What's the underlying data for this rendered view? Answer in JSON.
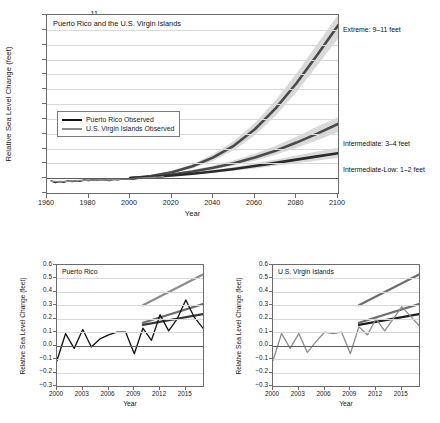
{
  "figure": {
    "cropped_title_fragment": ""
  },
  "main_panel": {
    "tag": "Puerto Rico and the U.S. Virgin Islands",
    "ylabel": "Relative Sea Level Change (feet)",
    "xlabel": "Year",
    "yticks": [
      "11",
      "10",
      "9",
      "8",
      "7",
      "6",
      "5",
      "4",
      "3",
      "2",
      "1",
      "0",
      "−1"
    ],
    "xticks": [
      "1960",
      "1980",
      "2000",
      "2020",
      "2040",
      "2060",
      "2080",
      "2100"
    ],
    "legend": [
      {
        "label": "Puerto Rico Observed",
        "color": "#111111"
      },
      {
        "label": "U.S. Virgin Islands Observed",
        "color": "#8d8d8d"
      }
    ],
    "annotations": [
      {
        "name": "extreme",
        "label": "Extreme: 9–11 feet"
      },
      {
        "name": "intermediate",
        "label": "Intermediate: 3–4 feet"
      },
      {
        "name": "intermediate-low",
        "label": "Intermediate-Low: 1–2 feet"
      }
    ]
  },
  "sub_panels": [
    {
      "key": "puerto-rico",
      "tag": "Puerto Rico",
      "ylabel": "Relative Sea Level Change (feet)",
      "xlabel": "Year",
      "yticks": [
        "0.6",
        "0.5",
        "0.4",
        "0.3",
        "0.2",
        "0.1",
        "0.0",
        "−0.1",
        "−0.2",
        "−0.3"
      ],
      "xticks": [
        "2000",
        "2003",
        "2006",
        "2009",
        "2012",
        "2015"
      ]
    },
    {
      "key": "us-virgin-islands",
      "tag": "U.S. Virgin Islands",
      "ylabel": "Relative Sea Level Change (feet)",
      "xlabel": "Year",
      "yticks": [
        "0.6",
        "0.5",
        "0.4",
        "0.3",
        "0.2",
        "0.1",
        "0.0",
        "−0.1",
        "−0.2",
        "−0.3"
      ],
      "xticks": [
        "2000",
        "2003",
        "2006",
        "2009",
        "2012",
        "2015"
      ]
    }
  ],
  "colors": {
    "observed_pr": "#111111",
    "observed_usvi": "#8d8d8d",
    "scenario_line_dark": "#4a4a4a",
    "scenario_line_darkest": "#2b2b2b",
    "band_light": "#d9d9d9",
    "band_mid": "#bfbfbf",
    "axis": "#6b6b6b",
    "grid": "#d8d8d8"
  },
  "chart_data": {
    "type": "line",
    "panels": [
      {
        "name": "main-projection",
        "title": "Puerto Rico and the U.S. Virgin Islands",
        "xlabel": "Year",
        "ylabel": "Relative Sea Level Change (feet)",
        "xlim": [
          1960,
          2100
        ],
        "ylim": [
          -1,
          11
        ],
        "xticks": [
          1960,
          1980,
          2000,
          2020,
          2040,
          2060,
          2080,
          2100
        ],
        "yticks": [
          -1,
          0,
          1,
          2,
          3,
          4,
          5,
          6,
          7,
          8,
          9,
          10,
          11
        ],
        "grid": true,
        "legend_position": "inside-left",
        "series": [
          {
            "name": "Puerto Rico Observed",
            "type": "observed",
            "color": "#111111",
            "x": [
              1962,
              1964,
              1966,
              1968,
              1970,
              1972,
              1974,
              1976,
              1978,
              1980,
              1982,
              1984,
              1986,
              1988,
              1990,
              1992,
              1994,
              1996,
              1998,
              2000,
              2002,
              2004,
              2006,
              2008,
              2010,
              2012,
              2014,
              2016
            ],
            "values": [
              -0.18,
              -0.3,
              -0.22,
              -0.28,
              -0.18,
              -0.22,
              -0.17,
              -0.2,
              -0.13,
              -0.16,
              -0.1,
              -0.14,
              -0.09,
              -0.12,
              -0.16,
              -0.08,
              -0.1,
              -0.05,
              -0.07,
              -0.02,
              -0.04,
              0.0,
              0.02,
              0.02,
              0.05,
              0.07,
              0.09,
              0.11
            ]
          },
          {
            "name": "U.S. Virgin Islands Observed",
            "type": "observed",
            "color": "#8d8d8d",
            "x": [
              1962,
              1966,
              1970,
              1974,
              1978,
              1982,
              1986,
              1990,
              1994,
              1998,
              2002,
              2006,
              2010,
              2014,
              2016
            ],
            "values": [
              -0.2,
              -0.24,
              -0.2,
              -0.18,
              -0.14,
              -0.12,
              -0.1,
              -0.13,
              -0.08,
              -0.05,
              -0.03,
              0.01,
              0.04,
              0.08,
              0.11
            ]
          },
          {
            "name": "Extreme",
            "type": "projection",
            "label": "Extreme: 9–11 feet",
            "color": "#4a4a4a",
            "x": [
              2000,
              2010,
              2020,
              2030,
              2040,
              2050,
              2060,
              2070,
              2080,
              2090,
              2100
            ],
            "values": [
              0.0,
              0.15,
              0.4,
              0.8,
              1.4,
              2.2,
              3.3,
              4.7,
              6.4,
              8.3,
              10.3
            ],
            "band_low": [
              0.0,
              0.12,
              0.32,
              0.66,
              1.18,
              1.9,
              2.9,
              4.2,
              5.8,
              7.6,
              9.4
            ],
            "band_high": [
              0.0,
              0.18,
              0.48,
              0.95,
              1.62,
              2.52,
              3.72,
              5.25,
              7.05,
              9.05,
              11.0
            ]
          },
          {
            "name": "Intermediate",
            "type": "projection",
            "label": "Intermediate: 3–4 feet",
            "color": "#4a4a4a",
            "x": [
              2000,
              2010,
              2020,
              2030,
              2040,
              2050,
              2060,
              2070,
              2080,
              2090,
              2100
            ],
            "values": [
              0.0,
              0.1,
              0.25,
              0.45,
              0.7,
              1.0,
              1.4,
              1.85,
              2.4,
              3.0,
              3.65
            ],
            "band_low": [
              0.0,
              0.08,
              0.2,
              0.37,
              0.58,
              0.85,
              1.18,
              1.58,
              2.05,
              2.55,
              3.1
            ],
            "band_high": [
              0.0,
              0.12,
              0.3,
              0.55,
              0.85,
              1.2,
              1.65,
              2.18,
              2.8,
              3.48,
              4.1
            ]
          },
          {
            "name": "Intermediate-Low",
            "type": "projection",
            "label": "Intermediate-Low: 1–2 feet",
            "color": "#2b2b2b",
            "x": [
              2000,
              2010,
              2020,
              2030,
              2040,
              2050,
              2060,
              2070,
              2080,
              2090,
              2100
            ],
            "values": [
              0.0,
              0.08,
              0.18,
              0.3,
              0.45,
              0.62,
              0.82,
              1.03,
              1.25,
              1.47,
              1.68
            ],
            "band_low": [
              0.0,
              0.06,
              0.14,
              0.24,
              0.36,
              0.5,
              0.66,
              0.83,
              1.01,
              1.19,
              1.36
            ],
            "band_high": [
              0.0,
              0.1,
              0.22,
              0.37,
              0.55,
              0.76,
              1.0,
              1.26,
              1.53,
              1.8,
              2.05
            ]
          }
        ]
      },
      {
        "name": "puerto-rico-detail",
        "title": "Puerto Rico",
        "xlabel": "Year",
        "ylabel": "Relative Sea Level Change (feet)",
        "xlim": [
          2000,
          2017
        ],
        "ylim": [
          -0.3,
          0.6
        ],
        "xticks": [
          2000,
          2003,
          2006,
          2009,
          2012,
          2015
        ],
        "yticks": [
          -0.3,
          -0.2,
          -0.1,
          0.0,
          0.1,
          0.2,
          0.3,
          0.4,
          0.5,
          0.6
        ],
        "grid": true,
        "series": [
          {
            "name": "Puerto Rico Observed",
            "type": "observed",
            "color": "#111111",
            "x": [
              2000,
              2001,
              2002,
              2003,
              2004,
              2005,
              2006,
              2007,
              2008,
              2009,
              2010,
              2011,
              2012,
              2013,
              2014,
              2015,
              2016,
              2017
            ],
            "values": [
              -0.11,
              0.09,
              -0.02,
              0.12,
              -0.01,
              0.05,
              0.08,
              0.1,
              0.1,
              -0.06,
              0.13,
              0.04,
              0.23,
              0.11,
              0.2,
              0.34,
              0.21,
              0.13
            ]
          },
          {
            "name": "Extreme",
            "type": "projection",
            "color": "#8d8d8d",
            "x": [
              2010,
              2017
            ],
            "values": [
              0.3,
              0.53
            ]
          },
          {
            "name": "Intermediate",
            "type": "projection",
            "color": "#6e6e6e",
            "x": [
              2010,
              2017
            ],
            "values": [
              0.17,
              0.31
            ]
          },
          {
            "name": "Intermediate-Low",
            "type": "projection",
            "color": "#3a3a3a",
            "x": [
              2010,
              2017
            ],
            "values": [
              0.155,
              0.235
            ]
          }
        ]
      },
      {
        "name": "us-virgin-islands-detail",
        "title": "U.S. Virgin Islands",
        "xlabel": "Year",
        "ylabel": "Relative Sea Level Change (feet)",
        "xlim": [
          2000,
          2017
        ],
        "ylim": [
          -0.3,
          0.6
        ],
        "xticks": [
          2000,
          2003,
          2006,
          2009,
          2012,
          2015
        ],
        "yticks": [
          -0.3,
          -0.2,
          -0.1,
          0.0,
          0.1,
          0.2,
          0.3,
          0.4,
          0.5,
          0.6
        ],
        "grid": true,
        "series": [
          {
            "name": "U.S. Virgin Islands Observed",
            "type": "observed",
            "color": "#8d8d8d",
            "x": [
              2000,
              2001,
              2002,
              2003,
              2004,
              2005,
              2006,
              2007,
              2008,
              2009,
              2010,
              2011,
              2012,
              2013,
              2014,
              2015,
              2016,
              2017
            ],
            "values": [
              -0.11,
              0.09,
              -0.02,
              0.09,
              -0.05,
              0.03,
              0.1,
              0.09,
              0.1,
              -0.06,
              0.14,
              0.08,
              0.2,
              0.11,
              0.2,
              0.29,
              0.22,
              0.15
            ]
          },
          {
            "name": "Extreme",
            "type": "projection",
            "color": "#6e6e6e",
            "x": [
              2010,
              2017
            ],
            "values": [
              0.3,
              0.53
            ]
          },
          {
            "name": "Intermediate",
            "type": "projection",
            "color": "#6e6e6e",
            "x": [
              2010,
              2017
            ],
            "values": [
              0.17,
              0.31
            ]
          },
          {
            "name": "Intermediate-Low",
            "type": "projection",
            "color": "#1f1f1f",
            "x": [
              2010,
              2017
            ],
            "values": [
              0.155,
              0.235
            ]
          }
        ]
      }
    ]
  }
}
